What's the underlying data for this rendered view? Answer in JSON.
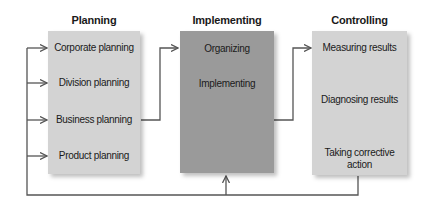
{
  "diagram": {
    "colors": {
      "light_box": "#d3d3d3",
      "dark_box": "#9a9a9a",
      "line": "#555555"
    },
    "columns": [
      {
        "title": "Planning",
        "items": [
          "Corporate planning",
          "Division planning",
          "Business planning",
          "Product planning"
        ]
      },
      {
        "title": "Implementing",
        "items": [
          "Organizing",
          "Implementing"
        ]
      },
      {
        "title": "Controlling",
        "items": [
          "Measuring results",
          "Diagnosing results",
          "Taking corrective",
          "action"
        ]
      }
    ]
  }
}
